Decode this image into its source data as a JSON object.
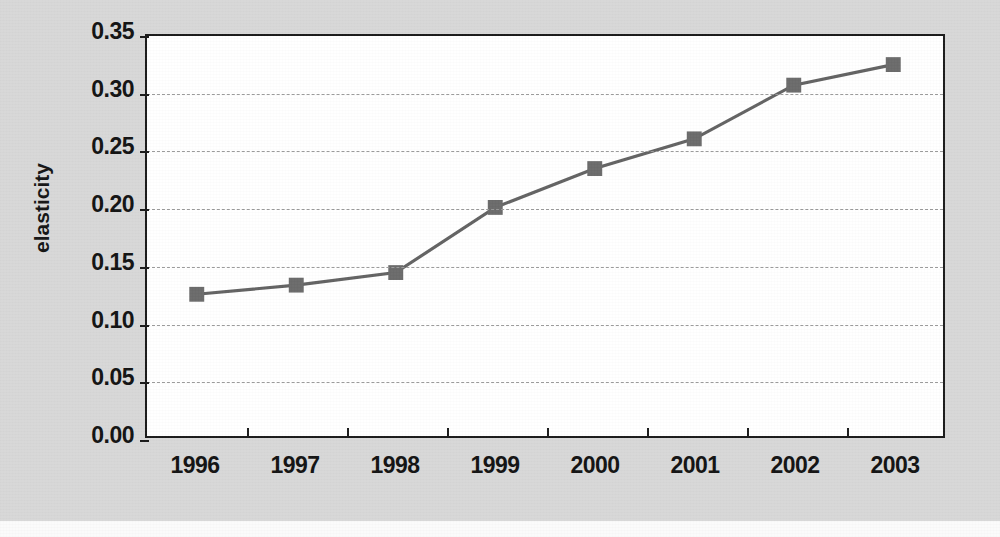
{
  "chart_data": {
    "type": "line",
    "title": "",
    "xlabel": "",
    "ylabel": "elasticity",
    "categories": [
      "1996",
      "1997",
      "1998",
      "1999",
      "2000",
      "2001",
      "2002",
      "2003"
    ],
    "values": [
      0.124,
      0.132,
      0.143,
      0.2,
      0.234,
      0.26,
      0.307,
      0.325
    ],
    "series": [
      {
        "name": "elasticity",
        "values": [
          0.124,
          0.132,
          0.143,
          0.2,
          0.234,
          0.26,
          0.307,
          0.325
        ]
      }
    ],
    "ylim": [
      0.0,
      0.35
    ],
    "ytick_labels": [
      "0.00",
      "0.05",
      "0.10",
      "0.15",
      "0.20",
      "0.25",
      "0.30",
      "0.35"
    ],
    "ytick_values": [
      0.0,
      0.05,
      0.1,
      0.15,
      0.2,
      0.25,
      0.3,
      0.35
    ],
    "grid": "horizontal-dashed",
    "legend": "none",
    "marker": "square",
    "colors": {
      "series_line": "#636363",
      "marker_fill": "#6b6b6b",
      "gridline": "#9a9a9a",
      "axis": "#1a1a1a",
      "plot_background": "#ffffff",
      "page_background": "#d8d8d8",
      "text": "#121212"
    }
  }
}
